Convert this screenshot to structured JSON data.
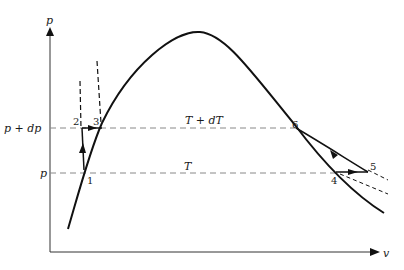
{
  "diagram": {
    "type": "p-v phase diagram (Clausius-Clapeyron cycle)",
    "axes": {
      "y_label": "p",
      "x_label": "v"
    },
    "pressure_levels": {
      "upper": "p + dp",
      "lower": "p"
    },
    "isotherm_labels": {
      "upper": "T + dT",
      "lower": "T"
    },
    "points": [
      "1",
      "2",
      "3",
      "4",
      "5",
      "6"
    ],
    "colors": {
      "curve": "#111111",
      "dashed": "#777777"
    }
  }
}
